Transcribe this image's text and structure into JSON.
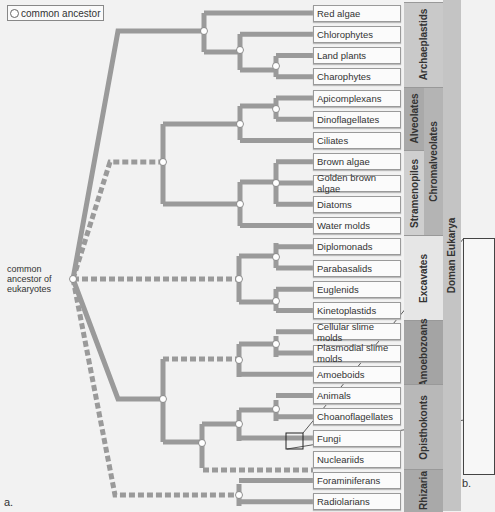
{
  "legend": {
    "label": "common ancestor",
    "icon": "open-circle-node-icon"
  },
  "root": {
    "label_lines": [
      "common",
      "ancestor of",
      "eukaryotes"
    ]
  },
  "taxa": [
    "Red algae",
    "Chlorophytes",
    "Land plants",
    "Charophytes",
    "Apicomplexans",
    "Dinoflagellates",
    "Ciliates",
    "Brown algae",
    "Golden brown algae",
    "Diatoms",
    "Water molds",
    "Diplomonads",
    "Parabasalids",
    "Euglenids",
    "Kinetoplastids",
    "Cellular slime molds",
    "Plasmodial slime molds",
    "Amoeboids",
    "Animals",
    "Choanoflagellates",
    "Fungi",
    "Nucleariids",
    "Foraminiferans",
    "Radiolarians"
  ],
  "groups_col1": [
    {
      "label": "Archaeplastids",
      "start": 0,
      "end": 3,
      "color": "#c9c9c9"
    },
    {
      "label": "Alveolates",
      "start": 4,
      "end": 6,
      "color": "#a9a9a9"
    },
    {
      "label": "Stramenopiles",
      "start": 7,
      "end": 10,
      "color": "#cfcfcf"
    },
    {
      "label": "Excavates",
      "start": 11,
      "end": 14,
      "color": "#e6e6e6"
    },
    {
      "label": "Amoebozoans",
      "start": 15,
      "end": 17,
      "color": "#a4a4a4"
    },
    {
      "label": "Opisthokonts",
      "start": 18,
      "end": 21,
      "color": "#b8b8b8"
    },
    {
      "label": "Rhizaria",
      "start": 22,
      "end": 23,
      "color": "#a9a9a9"
    }
  ],
  "groups_col2": [
    {
      "label": "Chromalveolates",
      "start": 4,
      "end": 10,
      "color": "#b4b4b4"
    }
  ],
  "domain": {
    "label": "Doman Eukarya",
    "color": "#c4c4c4"
  },
  "figure_labels": {
    "a": "a.",
    "b": "b."
  },
  "colors": {
    "branch": "#9a9a9a",
    "node_fill": "#ffffff"
  }
}
